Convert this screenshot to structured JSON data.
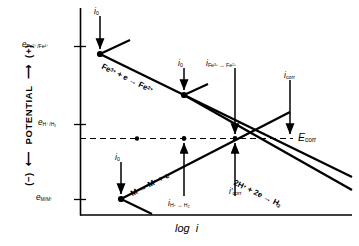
{
  "figure": {
    "type": "evans-polarization-diagram",
    "axes": {
      "y_title": "POTENTIAL",
      "y_positive_sign": "(+)",
      "y_negative_sign": "(−)",
      "x_title_italic": "log i",
      "x_title_plain": "log",
      "x_title_var": "i"
    },
    "potential_ticks": [
      {
        "id": "fe3-fe2",
        "symbol": "e",
        "sub": "Fe3+/Fe2+",
        "sub_html": "Fe³⁺/Fe²⁺",
        "y": 46
      },
      {
        "id": "h-h2",
        "symbol": "e",
        "sub": "H+/H2",
        "sub_html": "H⁺/H₂",
        "y": 124
      },
      {
        "id": "m-mplus",
        "symbol": "e",
        "sub": "M/M+",
        "sub_html": "M/M⁺",
        "y": 199
      }
    ],
    "corrosion_potential": {
      "label": "E",
      "sub": "corr",
      "label_full": "Ecorr"
    },
    "exchange_currents": [
      {
        "id": "i0-fe",
        "label": "i",
        "sub": "0"
      },
      {
        "id": "i0-h",
        "label": "i",
        "sub": "0"
      },
      {
        "id": "i0-m",
        "label": "i",
        "sub": "0"
      }
    ],
    "current_labels": [
      {
        "id": "i-fe3-fe2",
        "label": "i",
        "sub": "Fe3+ → Fe2+",
        "parts": [
          "Fe",
          "3+",
          " → ",
          "Fe",
          "2+"
        ]
      },
      {
        "id": "i-corr",
        "label": "i",
        "sub": "corr",
        "prime": false
      },
      {
        "id": "i-corr-prime",
        "label": "i",
        "sub": "corr",
        "prime": true
      },
      {
        "id": "i-h-h2",
        "label": "i",
        "sub": "H+ → H2",
        "parts": [
          "H",
          "+",
          " → ",
          "H",
          "2"
        ]
      }
    ],
    "reactions": [
      {
        "id": "fe-reduction",
        "text": "Fe3+ + e → Fe2+",
        "left": "Fe",
        "left_sup": "3+",
        "mid": " + e → ",
        "right": "Fe",
        "right_sup": "2+",
        "angle": 31
      },
      {
        "id": "m-oxidation",
        "text": "M → M+ + e",
        "left": "M",
        "mid": " → ",
        "right": "M",
        "right_sup": "+",
        "tail": " + e",
        "angle": -31
      },
      {
        "id": "h-reduction",
        "text": "2H+ + 2e → H2",
        "left": "2H",
        "left_sup": "+",
        "mid": " + 2e → ",
        "right": "H",
        "right_sub": "2",
        "angle": 31
      }
    ],
    "colors": {
      "line": "#000000",
      "axis": "#000000",
      "dashed": "#000000",
      "background": "#ffffff"
    }
  }
}
